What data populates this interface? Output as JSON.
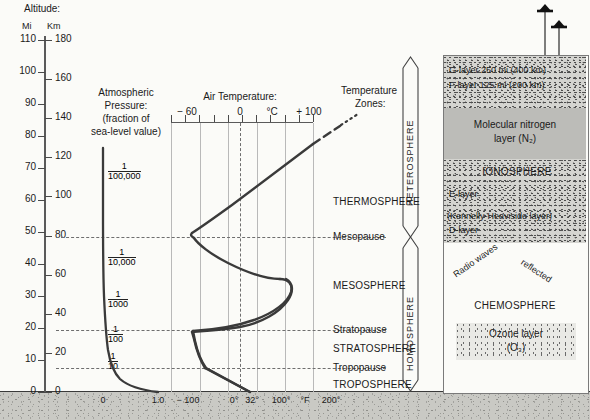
{
  "title_block": {
    "altitude_label": "Altitude:",
    "unit_mi": "Mi",
    "unit_km": "Km"
  },
  "axes": {
    "mi_ticks": [
      "110",
      "100",
      "90",
      "80",
      "70",
      "60",
      "50",
      "40",
      "30",
      "20",
      "10",
      "0"
    ],
    "km_ticks": [
      "180",
      "160",
      "140",
      "120",
      "100",
      "80",
      "60",
      "40",
      "20",
      "0"
    ],
    "pressure_title_line1": "Atmospheric",
    "pressure_title_line2": "Pressure:",
    "pressure_title_line3": "(fraction of",
    "pressure_title_line4": "sea-level value)",
    "pressure_fractions": [
      {
        "num": "1",
        "den": "100,000"
      },
      {
        "num": "1",
        "den": "10,000"
      },
      {
        "num": "1",
        "den": "1000"
      },
      {
        "num": "1",
        "den": "100"
      },
      {
        "num": "1",
        "den": "10"
      }
    ],
    "temperature_title": "Air Temperature:",
    "celsius_ticks": [
      "− 60",
      "0",
      "°C",
      "+ 100"
    ],
    "bottom_scale": [
      "0",
      "1.0",
      "− 100",
      "0°",
      "32°",
      "100°",
      "°F",
      "200°"
    ]
  },
  "zones": {
    "heading_line1": "Temperature",
    "heading_line2": "Zones:",
    "items": [
      "THERMOSPHERE",
      "Mesopause",
      "MESOSPHERE",
      "Stratopause",
      "STRATOSPHERE",
      "Tropopause",
      "TROPOSPHERE"
    ]
  },
  "spheres": {
    "upper": "HETEROSPHERE",
    "lower": "HOMOSPHERE"
  },
  "right_panel": {
    "g_layer": "G-layer 250 mi (400 km)",
    "f_layer": "F-layer 125 mi (200 km)",
    "nitrogen_line1": "Molecular nitrogen",
    "nitrogen_line2": "layer (N₂)",
    "ionosphere": "IONOSPHERE",
    "e_layer": "E-layer",
    "kennelly": "(Kennelly-Heaviside layer)",
    "d_layer": "D-layer",
    "radio_waves": "Radio waves",
    "reflected": "reflected",
    "chemosphere": "CHEMOSPHERE",
    "ozone_line1": "Ozone layer",
    "ozone_line2": "(O₃)"
  },
  "chart_data": {
    "type": "line",
    "xlabel": "Air Temperature (°C)",
    "ylabel": "Altitude (km / mi)",
    "ylim_km": [
      0,
      180
    ],
    "ylim_mi": [
      0,
      112
    ],
    "xlim_c": [
      -90,
      120
    ],
    "grid": "vertical solid gridlines plus dashed boundary lines at tropopause, stratopause, mesopause",
    "series": [
      {
        "name": "Air temperature profile",
        "x_celsius": [
          15,
          -55,
          -55,
          -50,
          -3,
          -3,
          -50,
          -88,
          -88,
          -45,
          10,
          60,
          110
        ],
        "y_km": [
          0,
          11,
          16,
          20,
          47,
          50,
          60,
          78,
          82,
          92,
          104,
          120,
          140
        ],
        "style": "solid heavy line; becomes dashed then dotted above ~140 km"
      },
      {
        "name": "Atmospheric pressure profile",
        "x_fraction_of_sea_level": [
          1.0,
          0.5,
          0.1,
          0.01,
          0.001,
          0.0001,
          1e-05
        ],
        "y_km": [
          0,
          5,
          16,
          31,
          48,
          68,
          95
        ],
        "style": "solid heavy line hugging the left axis above ~20 km"
      }
    ],
    "annotations": {
      "pressure_levels_km": [
        95,
        48,
        31,
        16,
        5
      ],
      "pressure_level_labels": [
        "1/100,000",
        "1/10,000",
        "1/1000",
        "1/100",
        "1/10"
      ],
      "boundaries_km": {
        "tropopause": 11,
        "stratopause": 48,
        "mesopause": 80
      },
      "celsius_gridlines": [
        -60,
        -40,
        -20,
        0,
        20,
        40,
        60,
        80,
        100
      ],
      "fahrenheit_labels": [
        "-100",
        "0°",
        "32°",
        "100°",
        "200°"
      ]
    }
  },
  "colors": {
    "ink": "#1a1a1a",
    "curve": "#333333",
    "grid": "#b9b9b9",
    "dash": "#6e6e6e",
    "ground": "#c9c9c4",
    "stipple_dark": "#d4d4d0",
    "stipple_light": "#e9e9e5",
    "solid_grey": "#bcbcb8"
  }
}
